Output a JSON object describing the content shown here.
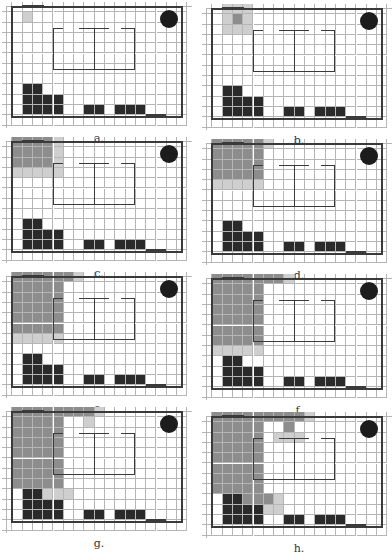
{
  "figure": {
    "grid": {
      "cols": 17,
      "rows": 11,
      "cell_w": 10.3,
      "cell_h": 10.3
    },
    "colors": {
      "visited": "#8d8d8d",
      "frontier": "#cfcfcf",
      "obstacle": "#2a2a2a",
      "wall": "#3a3a3a",
      "grid_line": "#b5b5b5",
      "goal": "#1c1c1c"
    },
    "obstacles": [
      [
        1,
        8
      ],
      [
        1,
        9
      ],
      [
        1,
        10
      ],
      [
        2,
        8
      ],
      [
        2,
        9
      ],
      [
        2,
        10
      ],
      [
        3,
        9
      ],
      [
        3,
        10
      ],
      [
        4,
        9
      ],
      [
        4,
        10
      ],
      [
        7,
        10
      ],
      [
        8,
        10
      ],
      [
        10,
        10
      ],
      [
        11,
        10
      ],
      [
        12,
        10
      ]
    ],
    "panels": [
      {
        "label": "a.",
        "visited": [],
        "frontier": [
          [
            1,
            1
          ]
        ]
      },
      {
        "label": "b.",
        "visited": [
          [
            2,
            1
          ]
        ],
        "frontier": [
          [
            1,
            0
          ],
          [
            2,
            0
          ],
          [
            3,
            0
          ],
          [
            1,
            1
          ],
          [
            3,
            1
          ],
          [
            1,
            2
          ],
          [
            2,
            2
          ],
          [
            3,
            2
          ]
        ]
      },
      {
        "label": "c.",
        "visited": [
          [
            0,
            0
          ],
          [
            1,
            0
          ],
          [
            2,
            0
          ],
          [
            3,
            0
          ],
          [
            0,
            1
          ],
          [
            1,
            1
          ],
          [
            2,
            1
          ],
          [
            3,
            1
          ],
          [
            0,
            2
          ],
          [
            1,
            2
          ],
          [
            2,
            2
          ],
          [
            3,
            2
          ]
        ],
        "frontier": [
          [
            4,
            0
          ],
          [
            4,
            1
          ],
          [
            4,
            2
          ],
          [
            0,
            3
          ],
          [
            1,
            3
          ],
          [
            2,
            3
          ],
          [
            3,
            3
          ],
          [
            4,
            3
          ]
        ]
      },
      {
        "label": "d.",
        "visited": [
          [
            0,
            0
          ],
          [
            1,
            0
          ],
          [
            2,
            0
          ],
          [
            3,
            0
          ],
          [
            4,
            0
          ],
          [
            0,
            1
          ],
          [
            1,
            1
          ],
          [
            2,
            1
          ],
          [
            3,
            1
          ],
          [
            4,
            1
          ],
          [
            0,
            2
          ],
          [
            1,
            2
          ],
          [
            2,
            2
          ],
          [
            3,
            2
          ],
          [
            4,
            2
          ],
          [
            0,
            3
          ],
          [
            1,
            3
          ],
          [
            2,
            3
          ],
          [
            3,
            3
          ],
          [
            4,
            3
          ]
        ],
        "frontier": [
          [
            5,
            0
          ],
          [
            0,
            4
          ],
          [
            1,
            4
          ],
          [
            2,
            4
          ],
          [
            3,
            4
          ],
          [
            4,
            4
          ]
        ]
      },
      {
        "label": "e.",
        "visited": [
          [
            0,
            0
          ],
          [
            1,
            0
          ],
          [
            2,
            0
          ],
          [
            3,
            0
          ],
          [
            4,
            0
          ],
          [
            5,
            0
          ],
          [
            0,
            1
          ],
          [
            1,
            1
          ],
          [
            2,
            1
          ],
          [
            3,
            1
          ],
          [
            4,
            1
          ],
          [
            0,
            2
          ],
          [
            1,
            2
          ],
          [
            2,
            2
          ],
          [
            3,
            2
          ],
          [
            4,
            2
          ],
          [
            0,
            3
          ],
          [
            1,
            3
          ],
          [
            2,
            3
          ],
          [
            3,
            3
          ],
          [
            4,
            3
          ],
          [
            0,
            4
          ],
          [
            1,
            4
          ],
          [
            2,
            4
          ],
          [
            3,
            4
          ],
          [
            4,
            4
          ],
          [
            0,
            5
          ],
          [
            1,
            5
          ],
          [
            2,
            5
          ],
          [
            3,
            5
          ],
          [
            4,
            5
          ]
        ],
        "frontier": [
          [
            6,
            0
          ],
          [
            0,
            6
          ],
          [
            1,
            6
          ],
          [
            2,
            6
          ],
          [
            3,
            6
          ],
          [
            4,
            6
          ]
        ]
      },
      {
        "label": "f.",
        "visited": [
          [
            0,
            0
          ],
          [
            1,
            0
          ],
          [
            2,
            0
          ],
          [
            3,
            0
          ],
          [
            4,
            0
          ],
          [
            5,
            0
          ],
          [
            6,
            0
          ],
          [
            0,
            1
          ],
          [
            1,
            1
          ],
          [
            2,
            1
          ],
          [
            3,
            1
          ],
          [
            4,
            1
          ],
          [
            0,
            2
          ],
          [
            1,
            2
          ],
          [
            2,
            2
          ],
          [
            3,
            2
          ],
          [
            4,
            2
          ],
          [
            0,
            3
          ],
          [
            1,
            3
          ],
          [
            2,
            3
          ],
          [
            3,
            3
          ],
          [
            4,
            3
          ],
          [
            0,
            4
          ],
          [
            1,
            4
          ],
          [
            2,
            4
          ],
          [
            3,
            4
          ],
          [
            4,
            4
          ],
          [
            0,
            5
          ],
          [
            1,
            5
          ],
          [
            2,
            5
          ],
          [
            3,
            5
          ],
          [
            4,
            5
          ],
          [
            0,
            6
          ],
          [
            1,
            6
          ],
          [
            2,
            6
          ],
          [
            3,
            6
          ],
          [
            4,
            6
          ]
        ],
        "frontier": [
          [
            7,
            0
          ],
          [
            0,
            7
          ],
          [
            1,
            7
          ],
          [
            2,
            7
          ],
          [
            3,
            7
          ],
          [
            4,
            7
          ]
        ]
      },
      {
        "label": "g.",
        "visited": [
          [
            0,
            0
          ],
          [
            1,
            0
          ],
          [
            2,
            0
          ],
          [
            3,
            0
          ],
          [
            4,
            0
          ],
          [
            5,
            0
          ],
          [
            6,
            0
          ],
          [
            7,
            0
          ],
          [
            0,
            1
          ],
          [
            1,
            1
          ],
          [
            2,
            1
          ],
          [
            3,
            1
          ],
          [
            4,
            1
          ],
          [
            0,
            2
          ],
          [
            1,
            2
          ],
          [
            2,
            2
          ],
          [
            3,
            2
          ],
          [
            4,
            2
          ],
          [
            0,
            3
          ],
          [
            1,
            3
          ],
          [
            2,
            3
          ],
          [
            3,
            3
          ],
          [
            4,
            3
          ],
          [
            0,
            4
          ],
          [
            1,
            4
          ],
          [
            2,
            4
          ],
          [
            3,
            4
          ],
          [
            4,
            4
          ],
          [
            0,
            5
          ],
          [
            1,
            5
          ],
          [
            2,
            5
          ],
          [
            3,
            5
          ],
          [
            4,
            5
          ],
          [
            0,
            6
          ],
          [
            1,
            6
          ],
          [
            2,
            6
          ],
          [
            3,
            6
          ],
          [
            4,
            6
          ],
          [
            0,
            7
          ],
          [
            1,
            7
          ],
          [
            2,
            7
          ],
          [
            3,
            7
          ],
          [
            4,
            7
          ]
        ],
        "frontier": [
          [
            7,
            1
          ],
          [
            8,
            0
          ],
          [
            2,
            8
          ],
          [
            3,
            8
          ],
          [
            4,
            8
          ],
          [
            5,
            8
          ]
        ]
      },
      {
        "label": "h.",
        "visited": [
          [
            0,
            0
          ],
          [
            1,
            0
          ],
          [
            2,
            0
          ],
          [
            3,
            0
          ],
          [
            4,
            0
          ],
          [
            5,
            0
          ],
          [
            6,
            0
          ],
          [
            7,
            0
          ],
          [
            8,
            0
          ],
          [
            0,
            1
          ],
          [
            1,
            1
          ],
          [
            2,
            1
          ],
          [
            3,
            1
          ],
          [
            4,
            1
          ],
          [
            7,
            1
          ],
          [
            0,
            2
          ],
          [
            1,
            2
          ],
          [
            2,
            2
          ],
          [
            3,
            2
          ],
          [
            4,
            2
          ],
          [
            0,
            3
          ],
          [
            1,
            3
          ],
          [
            2,
            3
          ],
          [
            3,
            3
          ],
          [
            4,
            3
          ],
          [
            0,
            4
          ],
          [
            1,
            4
          ],
          [
            2,
            4
          ],
          [
            3,
            4
          ],
          [
            4,
            4
          ],
          [
            0,
            5
          ],
          [
            1,
            5
          ],
          [
            2,
            5
          ],
          [
            3,
            5
          ],
          [
            4,
            5
          ],
          [
            0,
            6
          ],
          [
            1,
            6
          ],
          [
            2,
            6
          ],
          [
            3,
            6
          ],
          [
            4,
            6
          ],
          [
            0,
            7
          ],
          [
            1,
            7
          ],
          [
            2,
            7
          ],
          [
            3,
            7
          ],
          [
            4,
            7
          ],
          [
            2,
            8
          ],
          [
            3,
            8
          ],
          [
            4,
            8
          ],
          [
            5,
            8
          ]
        ],
        "frontier": [
          [
            9,
            0
          ],
          [
            6,
            2
          ],
          [
            7,
            2
          ],
          [
            8,
            2
          ],
          [
            6,
            8
          ],
          [
            5,
            9
          ],
          [
            6,
            9
          ],
          [
            4,
            9
          ]
        ]
      }
    ]
  }
}
